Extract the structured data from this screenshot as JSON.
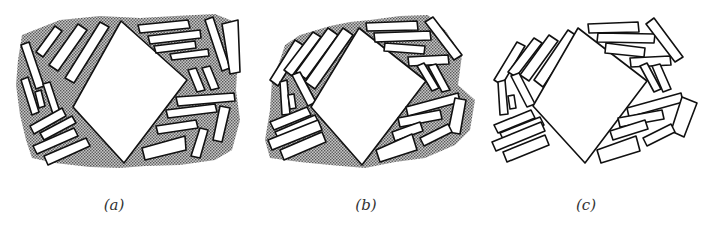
{
  "figure": {
    "colors": {
      "outline": "#111111",
      "fill": "#ffffff",
      "stipple": "#8a8a8a",
      "background": "#ffffff"
    },
    "panels": [
      {
        "id": "a",
        "label": "(a)",
        "shading": "dense stippled matrix"
      },
      {
        "id": "b",
        "label": "(b)",
        "shading": "partial stippled matrix"
      },
      {
        "id": "c",
        "label": "(c)",
        "shading": "no matrix"
      }
    ]
  }
}
